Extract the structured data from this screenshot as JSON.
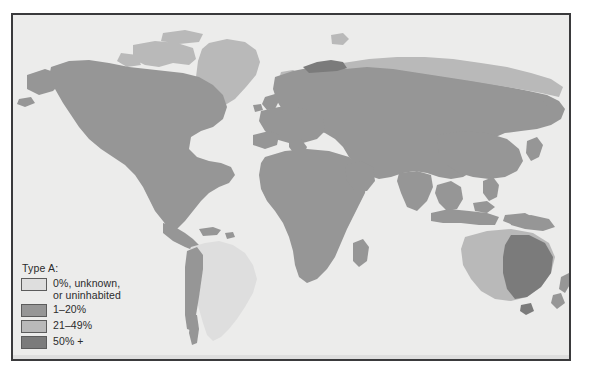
{
  "figure": {
    "kind": "choropleth-world-map",
    "background_color": "#ffffff",
    "frame_color": "#3a3a3c",
    "ocean_color": "#ececeb"
  },
  "legend": {
    "title": "Type A:",
    "items": [
      {
        "label": "0%, unknown,\nor uninhabited",
        "color": "#dedede",
        "range": "0"
      },
      {
        "label": "1–20%",
        "color": "#969696",
        "range": "1-20"
      },
      {
        "label": "21–49%",
        "color": "#b9b9b9",
        "range": "21-49"
      },
      {
        "label": "50% +",
        "color": "#7b7b7b",
        "range": "50+"
      }
    ]
  },
  "regions": [
    {
      "name": "greenland",
      "class": "mid-light"
    },
    {
      "name": "canada-arctic",
      "class": "mid-light"
    },
    {
      "name": "north-america",
      "class": "mid"
    },
    {
      "name": "siberia-north",
      "class": "mid-light"
    },
    {
      "name": "eurasia",
      "class": "mid"
    },
    {
      "name": "scandinavia-north",
      "class": "dark"
    },
    {
      "name": "africa",
      "class": "mid"
    },
    {
      "name": "south-america",
      "class": "light"
    },
    {
      "name": "andes",
      "class": "mid"
    },
    {
      "name": "australia-west",
      "class": "mid-light"
    },
    {
      "name": "australia-east",
      "class": "dark"
    },
    {
      "name": "new-zealand",
      "class": "mid"
    },
    {
      "name": "southeast-asia",
      "class": "mid"
    },
    {
      "name": "antarctica",
      "class": "light"
    }
  ]
}
